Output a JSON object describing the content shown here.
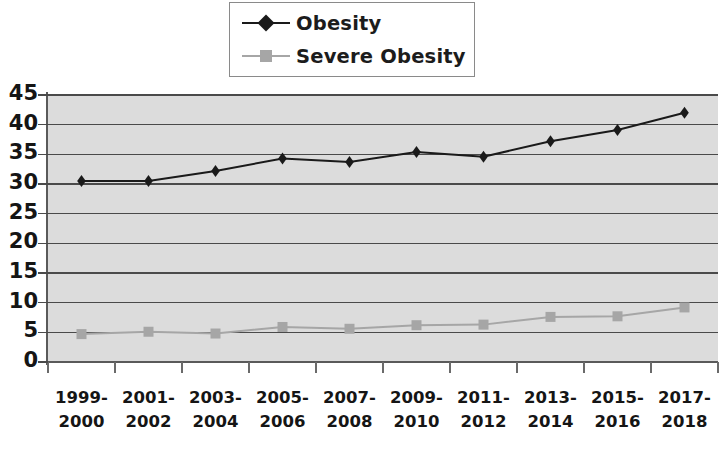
{
  "legend": {
    "position": "top-center",
    "items": [
      {
        "label": "Obesity",
        "color": "#1a1a1a",
        "marker": "diamond"
      },
      {
        "label": "Severe Obesity",
        "color": "#a6a6a6",
        "marker": "square"
      }
    ]
  },
  "axes": {
    "y_ticks": [
      "45",
      "40",
      "35",
      "30",
      "25",
      "20",
      "15",
      "10",
      "5",
      "0"
    ],
    "y_min": 0,
    "y_max": 45,
    "y_step": 5,
    "x_labels": [
      "1999-\n2000",
      "2001-\n2002",
      "2003-\n2004",
      "2005-\n2006",
      "2007-\n2008",
      "2009-\n2010",
      "2011-\n2012",
      "2013-\n2014",
      "2015-\n2016",
      "2017-\n2018"
    ]
  },
  "colors": {
    "plot_background": "#dcdcdc",
    "gridline": "#4a4a4a",
    "axis": "#5a5a5a",
    "obesity": "#1a1a1a",
    "severe_obesity": "#a6a6a6",
    "text": "#151515",
    "legend_border": "#8a8a8a"
  },
  "chart_data": {
    "type": "line",
    "title": "",
    "xlabel": "",
    "ylabel": "",
    "ylim": [
      0,
      45
    ],
    "ytick_step": 5,
    "grid": true,
    "legend_position": "top-center",
    "categories": [
      "1999-2000",
      "2001-2002",
      "2003-2004",
      "2005-2006",
      "2007-2008",
      "2009-2010",
      "2011-2012",
      "2013-2014",
      "2015-2016",
      "2017-2018"
    ],
    "series": [
      {
        "name": "Obesity",
        "color": "#1a1a1a",
        "marker": "diamond",
        "values": [
          30.5,
          30.5,
          32.2,
          34.3,
          33.7,
          35.4,
          34.6,
          37.2,
          39.1,
          42.0
        ]
      },
      {
        "name": "Severe Obesity",
        "color": "#a6a6a6",
        "marker": "square",
        "values": [
          4.7,
          5.1,
          4.8,
          5.9,
          5.6,
          6.2,
          6.3,
          7.6,
          7.7,
          9.2
        ]
      }
    ]
  }
}
